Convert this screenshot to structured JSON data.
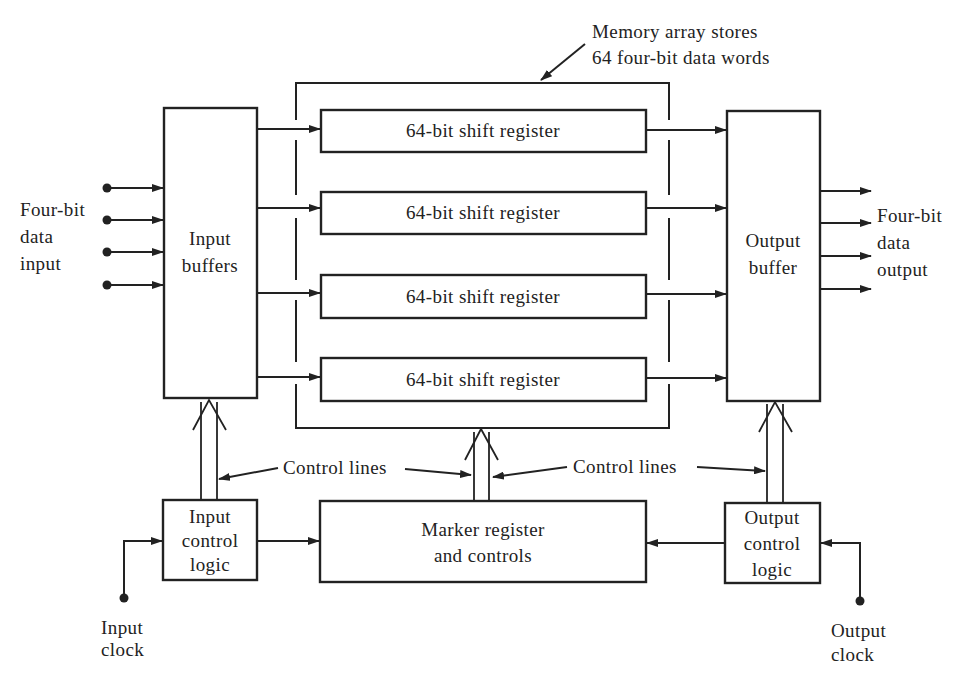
{
  "diagram": {
    "type": "block-diagram",
    "colors": {
      "ink": "#222222",
      "background": "#ffffff"
    },
    "memory_array": {
      "label_line1": "Memory array stores",
      "label_line2": "64 four-bit data words"
    },
    "input_side": {
      "label_line1": "Four-bit",
      "label_line2": "data",
      "label_line3": "input",
      "buffer_line1": "Input",
      "buffer_line2": "buffers"
    },
    "registers": [
      {
        "label": "64-bit shift register"
      },
      {
        "label": "64-bit shift register"
      },
      {
        "label": "64-bit shift register"
      },
      {
        "label": "64-bit shift register"
      }
    ],
    "output_side": {
      "buffer_line1": "Output",
      "buffer_line2": "buffer",
      "label_line1": "Four-bit",
      "label_line2": "data",
      "label_line3": "output"
    },
    "control": {
      "left_label": "Control lines",
      "right_label": "Control lines",
      "input_logic_line1": "Input",
      "input_logic_line2": "control",
      "input_logic_line3": "logic",
      "marker_line1": "Marker register",
      "marker_line2": "and controls",
      "output_logic_line1": "Output",
      "output_logic_line2": "control",
      "output_logic_line3": "logic"
    },
    "clocks": {
      "input_line1": "Input",
      "input_line2": "clock",
      "output_line1": "Output",
      "output_line2": "clock"
    }
  }
}
